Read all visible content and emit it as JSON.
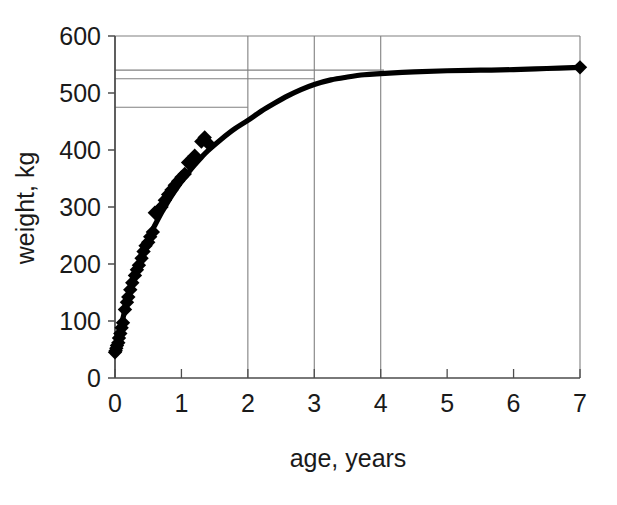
{
  "chart_data": {
    "type": "line",
    "title": "",
    "xlabel": "age, years",
    "ylabel": "weight, kg",
    "xlim": [
      0,
      7
    ],
    "ylim": [
      0,
      600
    ],
    "xticks": [
      0,
      1,
      2,
      3,
      4,
      5,
      6,
      7
    ],
    "yticks": [
      0,
      100,
      200,
      300,
      400,
      500,
      600
    ],
    "xtick_labels": [
      "0",
      "1",
      "2",
      "3",
      "4",
      "5",
      "6",
      "7"
    ],
    "ytick_labels": [
      "0",
      "100",
      "200",
      "300",
      "400",
      "500",
      "600"
    ],
    "grid": "vertical gridlines at x=2,3,4; horizontal frame line at y=600",
    "legend": "none",
    "series": [
      {
        "name": "fitted growth curve",
        "style": "thick solid black line",
        "x": [
          0,
          0.05,
          0.1,
          0.15,
          0.2,
          0.25,
          0.3,
          0.35,
          0.4,
          0.5,
          0.6,
          0.7,
          0.8,
          0.9,
          1.0,
          1.1,
          1.2,
          1.3,
          1.4,
          1.6,
          1.8,
          2.0,
          2.2,
          2.4,
          2.6,
          2.8,
          3.0,
          3.25,
          3.5,
          3.75,
          4.0,
          4.5,
          5.0,
          5.5,
          6.0,
          6.5,
          7.0
        ],
        "y": [
          45,
          70,
          95,
          120,
          143,
          163,
          182,
          199,
          215,
          244,
          268,
          290,
          310,
          328,
          345,
          360,
          374,
          387,
          399,
          419,
          437,
          452,
          468,
          482,
          495,
          506,
          515,
          523,
          528,
          532,
          534,
          537,
          539,
          540,
          541,
          543,
          545
        ]
      },
      {
        "name": "observed weights",
        "style": "black diamond markers",
        "x": [
          0.0,
          0.01,
          0.02,
          0.03,
          0.05,
          0.06,
          0.08,
          0.1,
          0.12,
          0.15,
          0.18,
          0.2,
          0.23,
          0.26,
          0.3,
          0.33,
          0.36,
          0.4,
          0.43,
          0.46,
          0.5,
          0.53,
          0.57,
          0.6,
          0.65,
          0.7,
          0.75,
          0.8,
          0.85,
          0.9,
          0.95,
          1.0,
          1.05,
          1.1,
          1.2,
          1.3,
          1.35,
          1.4,
          7.0
        ],
        "y": [
          45,
          48,
          52,
          57,
          62,
          70,
          78,
          88,
          97,
          120,
          133,
          142,
          155,
          167,
          180,
          190,
          198,
          210,
          222,
          232,
          238,
          248,
          256,
          290,
          293,
          300,
          312,
          322,
          330,
          338,
          345,
          352,
          358,
          378,
          390,
          415,
          422,
          412,
          545
        ]
      }
    ],
    "reference_lines": [
      {
        "orientation": "horizontal",
        "value": 540,
        "x_from": 0,
        "x_to": 4.05,
        "style": "thin grey"
      },
      {
        "orientation": "horizontal",
        "value": 525,
        "x_from": 0,
        "x_to": 3.0,
        "style": "thin grey"
      },
      {
        "orientation": "horizontal",
        "value": 475,
        "x_from": 0,
        "x_to": 2.0,
        "style": "thin grey"
      },
      {
        "orientation": "vertical",
        "value": 2,
        "y_from": 0,
        "y_to": 600,
        "style": "thin grey"
      },
      {
        "orientation": "vertical",
        "value": 3,
        "y_from": 0,
        "y_to": 600,
        "style": "thin grey"
      },
      {
        "orientation": "vertical",
        "value": 4,
        "y_from": 0,
        "y_to": 600,
        "style": "thin grey"
      }
    ],
    "colors": {
      "line": "#000000",
      "marker": "#000000",
      "axis": "#4d4d4d",
      "gridline": "#808080",
      "background": "#ffffff",
      "text": "#1a1a1a"
    }
  },
  "axes": {
    "x_title": "age, years",
    "y_title": "weight, kg"
  }
}
